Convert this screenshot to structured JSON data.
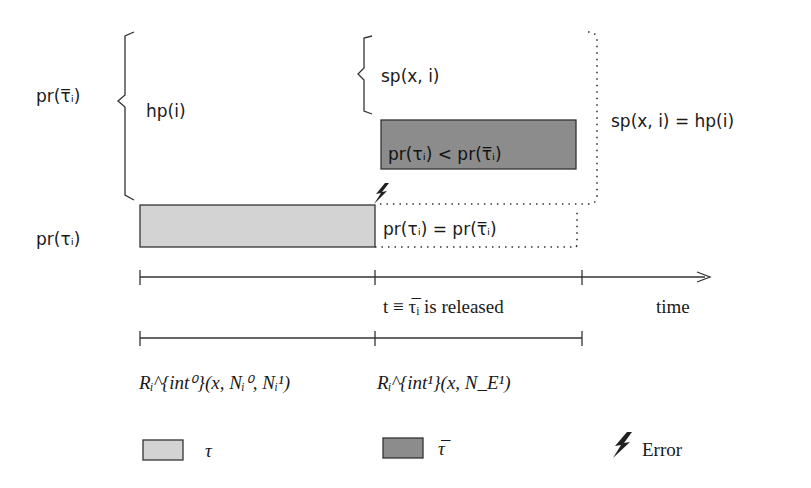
{
  "diagram": {
    "type": "priority-timeline",
    "colors": {
      "tau_box": "#d3d3d3",
      "tau_bar_box": "#8c8c8c",
      "stroke": "#333333"
    },
    "left_labels": {
      "pr_tau_bar": "pr(τ̅ᵢ)",
      "pr_tau": "pr(τᵢ)"
    },
    "brace_labels": {
      "hp": "hp(i)",
      "sp": "sp(x, i)"
    },
    "boxes": {
      "tau_bar_box_label": "pr(τᵢ) < pr(τ̅ᵢ)",
      "tau_dotted_label": "pr(τᵢ) = pr(τ̅ᵢ)"
    },
    "equality_label": "sp(x, i) = hp(i)",
    "timeline": {
      "release_label": "t ≡ τ̅ᵢ is released",
      "axis_label": "time"
    },
    "intervals": {
      "first": "Rᵢ^{int⁰}(x, Nᵢ⁰, Nᵢ¹)",
      "second": "Rᵢ^{int¹}(x, N_E¹)"
    },
    "legend": [
      {
        "symbol": "light-box",
        "label": "τ"
      },
      {
        "symbol": "dark-box",
        "label": "τ̅"
      },
      {
        "symbol": "lightning",
        "label": "Error"
      }
    ]
  }
}
